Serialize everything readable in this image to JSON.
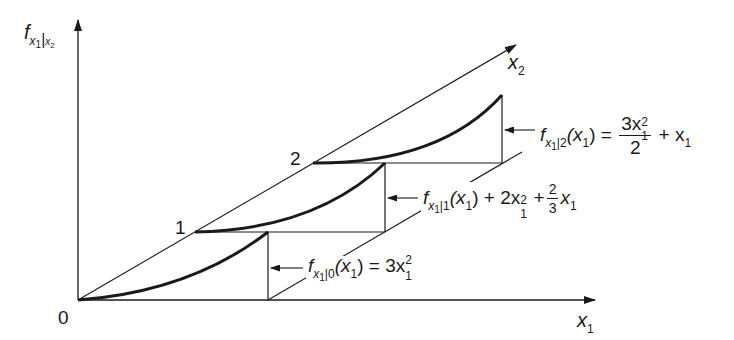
{
  "diagram": {
    "type": "conditional density slices in 3D (x1, x2, f)",
    "axes": {
      "vertical": {
        "label_main": "f",
        "label_sub1": "x",
        "label_sub1_idx": "1",
        "label_sep": "|",
        "label_sub2": "x",
        "label_sub2_idx": "2"
      },
      "x1": {
        "label": "x",
        "label_idx": "1"
      },
      "x2": {
        "label": "x",
        "label_idx": "2"
      },
      "origin": "0"
    },
    "points": [
      "1",
      "2"
    ],
    "slices": [
      {
        "x2_value": "0",
        "f": "f",
        "s1": "x",
        "s1i": "1",
        "sep": "|",
        "cond": "0",
        "arg": "(x",
        "argi": "1",
        "argc": ")",
        "rhs": "= 3x",
        "rhs_sub": "1",
        "rhs_sup": "2",
        "formula_text": "f_{x1|0}(x1) = 3x1^2"
      },
      {
        "x2_value": "1",
        "f": "f",
        "s1": "x",
        "s1i": "1",
        "sep": "|",
        "cond": "1",
        "arg": "(x",
        "argi": "1",
        "argc": ")",
        "rhs1": "+ 2x",
        "rhs1_sub": "1",
        "rhs1_sup": "2",
        "plus": "+",
        "frac_num": "2",
        "frac_den": "3",
        "rhs2": "x",
        "rhs2_sub": "1",
        "formula_text": "f_{x1|1}(x1) + 2x1^2 + (2/3)x1"
      },
      {
        "x2_value": "2",
        "f": "f",
        "s1": "x",
        "s1i": "1",
        "sep": "|",
        "cond": "2",
        "arg": "(x",
        "argi": "1",
        "argc": ")",
        "eq": "=",
        "frac_num": "3x",
        "frac_num_sub": "1",
        "frac_num_sup": "2",
        "frac_den": "2",
        "rhs2": "+ x",
        "rhs2_sub": "1",
        "formula_text": "f_{x1|2}(x1) = 3x1^2/2 + x1"
      }
    ]
  }
}
